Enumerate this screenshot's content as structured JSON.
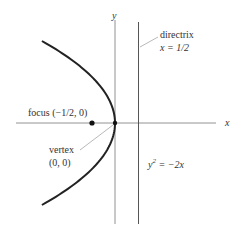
{
  "diagram": {
    "equation": {
      "base": "y",
      "exp": "2",
      "rhs": " = −2x"
    },
    "axes": {
      "x_label": "x",
      "y_label": "y"
    },
    "directrix": {
      "title": "directrix",
      "equation": "x = 1/2",
      "x": 0.5
    },
    "focus": {
      "label": "focus (−1/2, 0)",
      "x": -0.5,
      "y": 0
    },
    "vertex": {
      "label": "vertex",
      "coords": "(0, 0)",
      "x": 0,
      "y": 0
    },
    "colors": {
      "ink": "#222222",
      "axis": "#666666",
      "text": "#333333"
    }
  }
}
